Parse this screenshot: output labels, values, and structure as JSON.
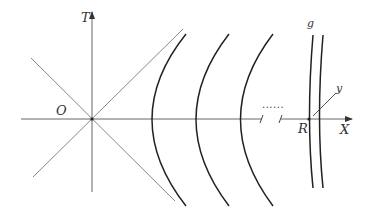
{
  "diagram": {
    "labels": {
      "t_axis": "T",
      "x_axis": "X",
      "origin": "O",
      "point_r": "R",
      "metric_g": "g",
      "coord_y": "y",
      "ellipsis": "......"
    },
    "colors": {
      "axis": "#555555",
      "light_cone": "#888888",
      "hyperbola": "#222222",
      "text": "#333333"
    },
    "elements": {
      "hyperbolae_count": 3,
      "hyperbola_vertices_x": [
        136,
        181,
        226
      ],
      "parallel_worldlines_count": 2
    }
  }
}
